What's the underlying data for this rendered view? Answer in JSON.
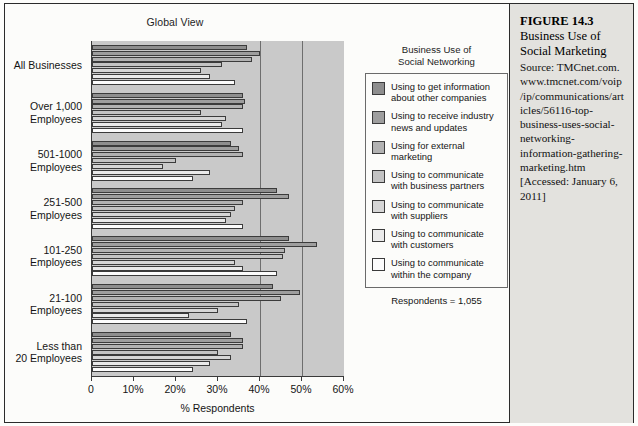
{
  "chart_title": "Global View",
  "legend": {
    "heading": "Business Use of\nSocial Networking",
    "respondents": "Respondents = 1,055",
    "items": [
      {
        "label": "Using to get information\nabout other companies",
        "color": "#8e8e8e"
      },
      {
        "label": "Using to receive industry\nnews and updates",
        "color": "#9e9e9e"
      },
      {
        "label": "Using for external\nmarketing",
        "color": "#b2b2b2"
      },
      {
        "label": "Using to communicate\nwith business partners",
        "color": "#c3c3c3"
      },
      {
        "label": "Using to communicate\nwith suppliers",
        "color": "#d6d6d6"
      },
      {
        "label": "Using to communicate\nwith customers",
        "color": "#eaeaea"
      },
      {
        "label": "Using to communicate\nwithin the company",
        "color": "#fcfcfc"
      }
    ]
  },
  "caption": {
    "figure_number": "FIGURE 14.3",
    "title": "Business Use of\nSocial Marketing",
    "source": "Source: TMCnet.com. www.tmcnet.com/voip/ip/communications/articles/56116-top-business-uses-social-networking-information-gathering-marketing.htm [Accessed: January 6, 2011]"
  },
  "chart_data": {
    "type": "bar",
    "orientation": "horizontal",
    "title": "Global View",
    "xlabel": "% Respondents",
    "ylabel": "",
    "xlim": [
      0,
      60
    ],
    "xticks": [
      0,
      10,
      20,
      30,
      40,
      50,
      60
    ],
    "xticklabels": [
      "0",
      "10%",
      "20%",
      "30%",
      "40%",
      "50%",
      "60%"
    ],
    "grid": false,
    "legend_position": "right",
    "categories": [
      "All Businesses",
      "Over 1,000\nEmployees",
      "501-1000\nEmployees",
      "251-500\nEmployees",
      "101-250\nEmployees",
      "21-100\nEmployees",
      "Less than\n20 Employees"
    ],
    "series": [
      {
        "name": "Using to get information about other companies",
        "color": "#8e8e8e",
        "values": [
          37,
          36,
          33,
          44,
          47,
          43,
          33
        ]
      },
      {
        "name": "Using to receive industry news and updates",
        "color": "#9e9e9e",
        "values": [
          40,
          36.5,
          35,
          47,
          53.5,
          49.5,
          36
        ]
      },
      {
        "name": "Using for external marketing",
        "color": "#b2b2b2",
        "values": [
          38,
          36,
          36,
          36,
          46,
          45,
          36
        ]
      },
      {
        "name": "Using to communicate with business partners",
        "color": "#c3c3c3",
        "values": [
          31,
          26,
          20,
          34,
          45.5,
          35,
          30
        ]
      },
      {
        "name": "Using to communicate with suppliers",
        "color": "#d6d6d6",
        "values": [
          26,
          32,
          17,
          33,
          34,
          30,
          33
        ]
      },
      {
        "name": "Using to communicate with customers",
        "color": "#eaeaea",
        "values": [
          28,
          31,
          28,
          32,
          36,
          23,
          28
        ]
      },
      {
        "name": "Using to communicate within the company",
        "color": "#fcfcfc",
        "values": [
          34,
          36,
          24,
          36,
          44,
          37,
          24
        ]
      }
    ]
  }
}
